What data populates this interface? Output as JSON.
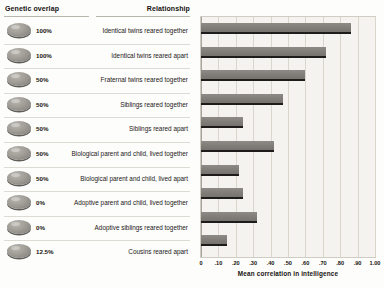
{
  "headers": {
    "genetic_overlap": "Genetic overlap",
    "relationship": "Relationship"
  },
  "rows": [
    {
      "overlap": "100%",
      "relationship": "Identical twins reared together",
      "value": 0.86
    },
    {
      "overlap": "100%",
      "relationship": "Identical twins reared apart",
      "value": 0.72
    },
    {
      "overlap": "50%",
      "relationship": "Fraternal twins reared together",
      "value": 0.6
    },
    {
      "overlap": "50%",
      "relationship": "Siblings reared together",
      "value": 0.47
    },
    {
      "overlap": "50%",
      "relationship": "Siblings reared apart",
      "value": 0.24
    },
    {
      "overlap": "50%",
      "relationship": "Biological parent and child, lived together",
      "value": 0.42
    },
    {
      "overlap": "50%",
      "relationship": "Biological parent and child, lived apart",
      "value": 0.22
    },
    {
      "overlap": "0%",
      "relationship": "Adoptive parent and child, lived together",
      "value": 0.24
    },
    {
      "overlap": "0%",
      "relationship": "Adoptive siblings reared together",
      "value": 0.32
    },
    {
      "overlap": "12.5%",
      "relationship": "Cousins reared apart",
      "value": 0.15
    }
  ],
  "chart_data": {
    "type": "bar",
    "orientation": "horizontal",
    "title": "",
    "xlabel": "Mean correlation in intelligence",
    "ylabel": "",
    "xlim": [
      0,
      1.0
    ],
    "grid": true,
    "legend": "none",
    "tick_labels": [
      "0",
      ".10",
      ".20",
      ".30",
      ".40",
      ".50",
      ".60",
      ".70",
      ".80",
      ".90",
      "1.00"
    ],
    "tick_values": [
      0,
      0.1,
      0.2,
      0.3,
      0.4,
      0.5,
      0.6,
      0.7,
      0.8,
      0.9,
      1.0
    ],
    "categories": [
      "Identical twins reared together",
      "Identical twins reared apart",
      "Fraternal twins reared together",
      "Siblings reared together",
      "Siblings reared apart",
      "Biological parent and child, lived together",
      "Biological parent and child, lived apart",
      "Adoptive parent and child, lived together",
      "Adoptive siblings reared together",
      "Cousins reared apart"
    ],
    "values": [
      0.86,
      0.72,
      0.6,
      0.47,
      0.24,
      0.42,
      0.22,
      0.24,
      0.32,
      0.15
    ],
    "bar_color": "#807d78",
    "plot_background": "#f4f3ef",
    "gridline_color": "#d9d6ce"
  },
  "axis": {
    "title": "Mean correlation in intelligence"
  }
}
